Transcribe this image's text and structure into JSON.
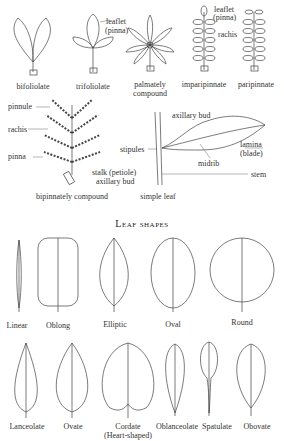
{
  "compound_leaves": {
    "bifoliolate": "bifoliolate",
    "trifoliolate": "trifoliolate",
    "palmately_1": "palmately",
    "palmately_2": "compound",
    "imparipinnate": "imparipinnate",
    "paripinnate": "paripinnate",
    "leaflet_1": "leaflet",
    "leaflet_2": "(pinna)",
    "leaflet2_1": "leaflet",
    "leaflet2_2": "(pinna)",
    "rachis": "rachis"
  },
  "bipinnate": {
    "caption": "bipinnately compound",
    "pinnule": "pinnule",
    "rachis": "rachis",
    "pinna": "pinna",
    "stalk": "stalk (petiole)",
    "axillary_bud": "axillary bud"
  },
  "simple_leaf": {
    "caption": "simple leaf",
    "axillary_bud": "axillary bud",
    "stipules": "stipules",
    "lamina_1": "lamina",
    "lamina_2": "(blade)",
    "midrib": "midrib",
    "stem": "stem"
  },
  "section_title": "Leaf shapes",
  "shapes_row1": [
    "Linear",
    "Oblong",
    "Elliptic",
    "Oval",
    "Round"
  ],
  "shapes_row2": [
    "Lanceolate",
    "Ovate",
    "Cordate",
    "Oblanceolate",
    "Spatulate",
    "Obovate"
  ],
  "cordate_note": "(Heart-shaped)"
}
